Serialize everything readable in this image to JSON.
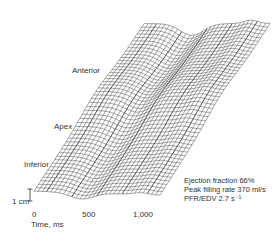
{
  "chart_data": {
    "type": "surface",
    "title": "",
    "xlabel": "Time, ms",
    "x_ticks": [
      "0",
      "500",
      "1,000"
    ],
    "y_axis_labels": [
      "Anterior",
      "Apex",
      "Inferior"
    ],
    "z_scale_bar": "1 cm",
    "annotations": {
      "ejection_fraction": "Ejection fraction 66%",
      "peak_filling_rate": "Peak filling rate 370 ml/s",
      "pfr_edv": "PFR/EDV  2.7 s⁻¹"
    },
    "grid": false,
    "legend": "none"
  },
  "labels": {
    "anterior": "Anterior",
    "apex": "Apex",
    "inferior": "Inferior",
    "scale": "1 cm",
    "tick0": "0",
    "tick500": "500",
    "tick1000": "1,000",
    "xlabel": "Time, ms"
  },
  "colors": {
    "line": "#3a3a3a",
    "background": "#ffffff"
  }
}
